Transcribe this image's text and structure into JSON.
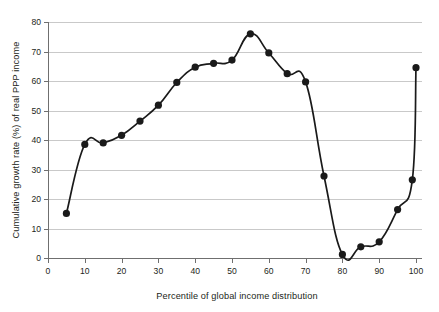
{
  "chart_data": {
    "type": "line",
    "title": "",
    "subtitle": "",
    "xlabel": "Percentile of global income distribution",
    "ylabel": "Cumulative growth rate (%) of real PPP income",
    "xlim": [
      0,
      100
    ],
    "ylim": [
      0,
      80
    ],
    "xticks": [
      0,
      10,
      20,
      30,
      40,
      50,
      60,
      70,
      80,
      90,
      100
    ],
    "yticks": [
      0,
      10,
      20,
      30,
      40,
      50,
      60,
      70,
      80
    ],
    "xtick_labels": [
      "0",
      "10",
      "20",
      "30",
      "40",
      "50",
      "60",
      "70",
      "80",
      "90",
      "100"
    ],
    "ytick_labels": [
      "0",
      "10",
      "20",
      "30",
      "40",
      "50",
      "60",
      "70",
      "80"
    ],
    "grid": "horizontal",
    "legend": "none",
    "marker": "filled-circle",
    "line_color": "#1a1a1a",
    "grid_color": "#c9c9c9",
    "axis_color": "#6f6f6f",
    "background": "#ffffff",
    "x": [
      5,
      10,
      15,
      20,
      25,
      30,
      35,
      40,
      45,
      50,
      55,
      60,
      65,
      70,
      75,
      80,
      85,
      90,
      95,
      99,
      100
    ],
    "values": [
      15.1,
      38.5,
      39.0,
      41.6,
      46.4,
      51.8,
      59.5,
      64.7,
      66.0,
      67.1,
      76.0,
      69.5,
      62.5,
      59.7,
      27.8,
      1.2,
      3.8,
      5.5,
      16.4,
      26.5,
      64.5
    ],
    "series": [
      {
        "name": "Cumulative real PPP income growth 1988-2008",
        "x": [
          5,
          10,
          15,
          20,
          25,
          30,
          35,
          40,
          45,
          50,
          55,
          60,
          65,
          70,
          75,
          80,
          85,
          90,
          95,
          99,
          100
        ],
        "values": [
          15.1,
          38.5,
          39.0,
          41.6,
          46.4,
          51.8,
          59.5,
          64.7,
          66.0,
          67.1,
          76.0,
          69.5,
          62.5,
          59.7,
          27.8,
          1.2,
          3.8,
          5.5,
          16.4,
          26.5,
          64.5
        ]
      }
    ],
    "annotations": []
  }
}
